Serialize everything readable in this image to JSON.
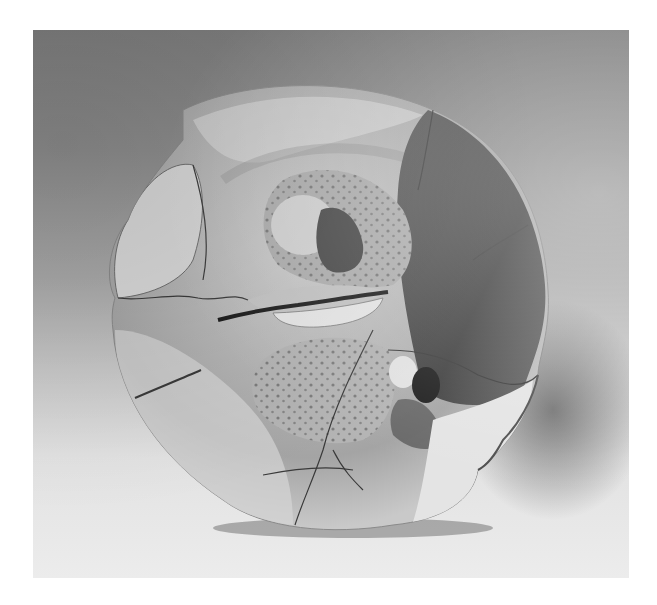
{
  "image": {
    "kind": "photograph",
    "style": "black-and-white",
    "subject": "cracked ceramic plate with sculpted face relief",
    "colors": {
      "page_background": "#ffffff",
      "backdrop_top": "#7d7d7d",
      "backdrop_bottom": "#ececec",
      "plate_light": "#d6d6d6",
      "plate_mid": "#9a9a9a",
      "plate_dark": "#3a3a3a",
      "shadow": "#5a5a5a"
    },
    "features": [
      "nose",
      "mouth",
      "chin",
      "stippled texture",
      "cracks",
      "dark glaze region",
      "shadow"
    ]
  }
}
